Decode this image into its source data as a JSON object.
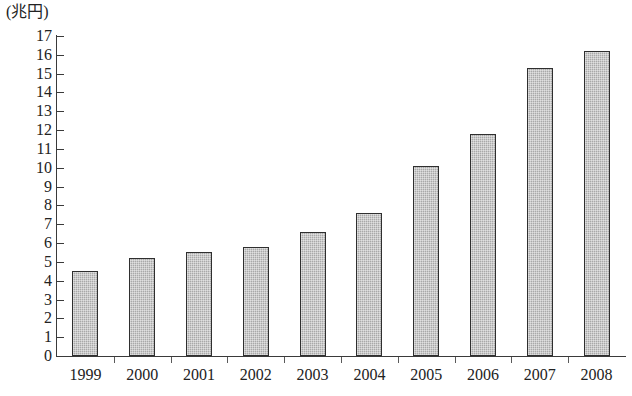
{
  "chart_data": {
    "type": "bar",
    "title": "",
    "subtitle": "",
    "xlabel": "",
    "ylabel": "(兆円)",
    "unit_label": "(兆円)",
    "categories": [
      "1999",
      "2000",
      "2001",
      "2002",
      "2003",
      "2004",
      "2005",
      "2006",
      "2007",
      "2008"
    ],
    "values": [
      4.5,
      5.2,
      5.5,
      5.8,
      6.6,
      7.6,
      10.1,
      11.8,
      15.3,
      16.2
    ],
    "series": [
      {
        "name": "",
        "values": [
          4.5,
          5.2,
          5.5,
          5.8,
          6.6,
          7.6,
          10.1,
          11.8,
          15.3,
          16.2
        ]
      }
    ],
    "ylim": [
      0,
      17
    ],
    "ytick_step": 1,
    "yticks": [
      "0",
      "1",
      "2",
      "3",
      "4",
      "5",
      "6",
      "7",
      "8",
      "9",
      "10",
      "11",
      "12",
      "13",
      "14",
      "15",
      "16",
      "17"
    ],
    "grid": false,
    "legend": null,
    "legend_position": "none",
    "bar_color": "#a9a9a9",
    "bar_border_color": "#2f2f2f",
    "axis_color": "#3a3a3a",
    "background_color": "#ffffff"
  }
}
